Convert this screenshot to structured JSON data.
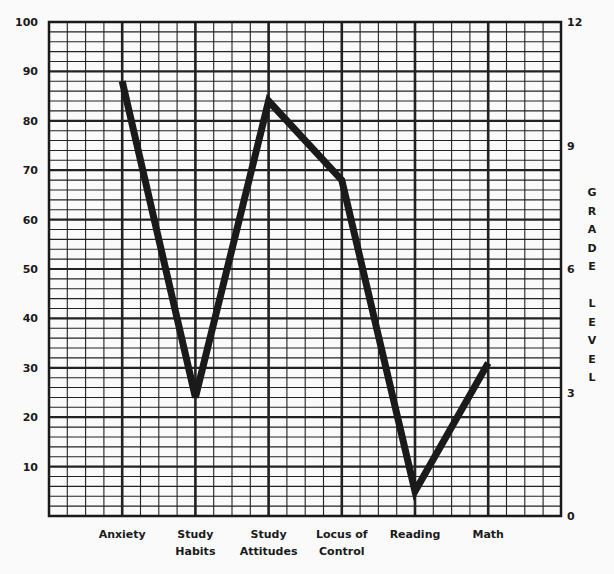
{
  "chart_data": {
    "type": "line",
    "title": "",
    "categories": [
      "Anxiety",
      "Study Habits",
      "Study Attitudes",
      "Locus of Control",
      "Reading",
      "Math"
    ],
    "category_lines": [
      [
        "Anxiety"
      ],
      [
        "Study",
        "Habits"
      ],
      [
        "Study",
        "Attitudes"
      ],
      [
        "Locus of",
        "Control"
      ],
      [
        "Reading"
      ],
      [
        "Math"
      ]
    ],
    "series": [
      {
        "name": "Profile",
        "values": [
          88,
          24,
          84,
          68,
          5,
          31
        ]
      }
    ],
    "xlabel": "",
    "ylabel": "",
    "ylim": [
      0,
      100
    ],
    "yticks": [
      10,
      20,
      30,
      40,
      50,
      60,
      70,
      80,
      90,
      100
    ],
    "y2label": "GRADE LEVEL",
    "y2label_letters": [
      "G",
      "R",
      "A",
      "D",
      "E",
      "",
      "L",
      "E",
      "V",
      "E",
      "L"
    ],
    "y2lim": [
      0,
      12
    ],
    "y2ticks": [
      0,
      3,
      6,
      9,
      12
    ],
    "grid": true,
    "grid_minor_y_step": 2,
    "grid_minor_x_per_category": 4,
    "legend": "none",
    "line_color": "#1a1a1a",
    "grid_color": "#222222"
  }
}
